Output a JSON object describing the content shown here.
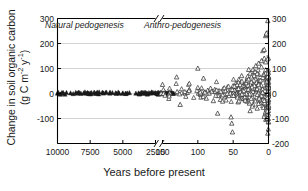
{
  "chart_data": {
    "type": "scatter",
    "title": "",
    "xlabel": "Years before present",
    "ylabel_line1": "Change in soil organic carbon",
    "ylabel_line2": "(g C m⁻² y⁻¹)",
    "ylabel_units_prefix": "(g C m",
    "ylabel_units_sup1": "-2",
    "ylabel_units_mid": " y",
    "ylabel_units_sup2": "-1",
    "ylabel_units_suffix": ")",
    "ylim": [
      -200,
      300
    ],
    "y_ticks_left": [
      "300",
      "200",
      "100",
      "0",
      "-100"
    ],
    "y_ticks_right": [
      "300",
      "200",
      "100",
      "0",
      "-100",
      "-200"
    ],
    "x_ticks_left_segment": [
      "10000",
      "7500",
      "5000",
      "2500"
    ],
    "x_ticks_right_segment": [
      "150",
      "100",
      "50",
      "0"
    ],
    "x_axis_broken": true,
    "x_break_symbol": "//",
    "grid": "horizontal-light",
    "legend_position": "none",
    "annotations": [
      {
        "text": "Natural pedogenesis",
        "x_frac": 0.13,
        "y_value": 270,
        "style": "italic"
      },
      {
        "text": "Anthro-pedogenesis",
        "x_frac": 0.6,
        "y_value": 270,
        "style": "italic"
      }
    ],
    "colors": {
      "axis": "#000000",
      "gridline": "#c9c9c9",
      "marker_filled": "#1a1a1a",
      "marker_open_stroke": "#303030",
      "marker_open_fill": "#ffffff",
      "background": "#ffffff"
    },
    "series": [
      {
        "name": "Natural pedogenesis (filled triangles)",
        "marker": "triangle-filled",
        "axis_segment": "left",
        "points": [
          [
            10000,
            0
          ],
          [
            9000,
            1
          ],
          [
            8800,
            -2
          ],
          [
            8600,
            3
          ],
          [
            8500,
            0
          ],
          [
            8400,
            4
          ],
          [
            8300,
            2
          ],
          [
            8200,
            -1
          ],
          [
            8000,
            1
          ],
          [
            7900,
            5
          ],
          [
            7800,
            0
          ],
          [
            7700,
            3
          ],
          [
            7600,
            -2
          ],
          [
            7500,
            1
          ],
          [
            7400,
            2
          ],
          [
            7000,
            0
          ],
          [
            6500,
            1
          ],
          [
            6000,
            0
          ],
          [
            5800,
            2
          ],
          [
            5500,
            -1
          ],
          [
            5000,
            1
          ],
          [
            4800,
            0
          ],
          [
            4500,
            2
          ],
          [
            4000,
            0
          ],
          [
            3800,
            1
          ],
          [
            3600,
            3
          ],
          [
            3500,
            0
          ],
          [
            3400,
            2
          ],
          [
            3300,
            4
          ],
          [
            3200,
            1
          ],
          [
            3100,
            -1
          ],
          [
            3000,
            2
          ],
          [
            2900,
            0
          ],
          [
            2800,
            5
          ],
          [
            2700,
            3
          ],
          [
            2600,
            1
          ],
          [
            2500,
            2
          ],
          [
            2400,
            0
          ],
          [
            2300,
            4
          ],
          [
            2200,
            1
          ],
          [
            2100,
            3
          ],
          [
            2000,
            0
          ],
          [
            1900,
            2
          ],
          [
            1800,
            6
          ],
          [
            1700,
            1
          ],
          [
            1600,
            0
          ],
          [
            1500,
            3
          ],
          [
            1400,
            2
          ],
          [
            1300,
            5
          ],
          [
            1200,
            1
          ],
          [
            1100,
            0
          ]
        ]
      },
      {
        "name": "Anthro-pedogenesis (open triangles)",
        "marker": "triangle-open",
        "axis_segment": "right",
        "points": [
          [
            152,
            0
          ],
          [
            150,
            35
          ],
          [
            148,
            2
          ],
          [
            130,
            65
          ],
          [
            128,
            1
          ],
          [
            125,
            -45
          ],
          [
            118,
            0
          ],
          [
            115,
            3
          ],
          [
            112,
            15
          ],
          [
            100,
            100
          ],
          [
            99,
            0
          ],
          [
            98,
            10
          ],
          [
            96,
            -5
          ],
          [
            92,
            60
          ],
          [
            90,
            5
          ],
          [
            88,
            -20
          ],
          [
            86,
            12
          ],
          [
            84,
            0
          ],
          [
            82,
            20
          ],
          [
            80,
            8
          ],
          [
            78,
            -30
          ],
          [
            76,
            15
          ],
          [
            74,
            5
          ],
          [
            72,
            -80
          ],
          [
            70,
            10
          ],
          [
            68,
            -25
          ],
          [
            66,
            0
          ],
          [
            64,
            18
          ],
          [
            62,
            -15
          ],
          [
            60,
            5
          ],
          [
            58,
            25
          ],
          [
            56,
            -10
          ],
          [
            55,
            12
          ],
          [
            54,
            0
          ],
          [
            53,
            -95
          ],
          [
            52,
            -120
          ],
          [
            51,
            -155
          ],
          [
            50,
            30
          ],
          [
            49,
            8
          ],
          [
            48,
            -5
          ],
          [
            47,
            20
          ],
          [
            46,
            40
          ],
          [
            45,
            0
          ],
          [
            44,
            15
          ],
          [
            43,
            -35
          ],
          [
            42,
            55
          ],
          [
            41,
            5
          ],
          [
            40,
            25
          ],
          [
            39,
            -10
          ],
          [
            38,
            70
          ],
          [
            37,
            12
          ],
          [
            36,
            0
          ],
          [
            35,
            35
          ],
          [
            34,
            18
          ],
          [
            33,
            -20
          ],
          [
            32,
            45
          ],
          [
            31,
            8
          ],
          [
            30,
            60
          ],
          [
            29,
            0
          ],
          [
            28,
            22
          ],
          [
            27,
            -40
          ],
          [
            26,
            80
          ],
          [
            25,
            10
          ],
          [
            24,
            30
          ],
          [
            23,
            -15
          ],
          [
            22,
            95
          ],
          [
            21,
            5
          ],
          [
            20,
            40
          ],
          [
            19,
            0
          ],
          [
            18,
            110
          ],
          [
            17,
            15
          ],
          [
            16,
            -60
          ],
          [
            15,
            50
          ],
          [
            14,
            120
          ],
          [
            13,
            8
          ],
          [
            12,
            35
          ],
          [
            11,
            -25
          ],
          [
            10,
            130
          ],
          [
            9,
            20
          ],
          [
            8,
            170
          ],
          [
            7,
            0
          ],
          [
            6,
            175
          ],
          [
            5,
            60
          ],
          [
            4,
            230
          ],
          [
            3,
            235
          ],
          [
            3,
            240
          ],
          [
            2,
            45
          ],
          [
            2,
            -90
          ],
          [
            1,
            290
          ],
          [
            1,
            -100
          ],
          [
            1,
            -160
          ],
          [
            5,
            -85
          ],
          [
            8,
            -50
          ],
          [
            12,
            -30
          ],
          [
            16,
            25
          ],
          [
            20,
            85
          ],
          [
            24,
            65
          ],
          [
            28,
            95
          ],
          [
            6,
            140
          ],
          [
            4,
            125
          ],
          [
            10,
            105
          ],
          [
            14,
            75
          ],
          [
            18,
            55
          ],
          [
            22,
            -45
          ],
          [
            26,
            -70
          ],
          [
            30,
            18
          ],
          [
            34,
            -8
          ],
          [
            38,
            42
          ],
          [
            42,
            28
          ]
        ]
      }
    ]
  }
}
